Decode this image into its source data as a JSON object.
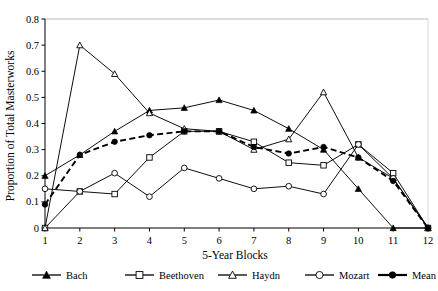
{
  "chart_data": {
    "type": "line",
    "title": "",
    "xlabel": "5-Year Blocks",
    "ylabel": "Proportion of Total Masterworks",
    "xlim": [
      1,
      12
    ],
    "ylim": [
      0,
      0.8
    ],
    "grid": false,
    "legend_position": "bottom",
    "x": [
      1,
      2,
      3,
      4,
      5,
      6,
      7,
      8,
      9,
      10,
      11,
      12
    ],
    "xticklabels": [
      "1",
      "2",
      "3",
      "4",
      "5",
      "6",
      "7",
      "8",
      "9",
      "10",
      "11",
      "12"
    ],
    "yticklabels": [
      "0",
      "0.1",
      "0.2",
      "0.3",
      "0.4",
      "0.5",
      "0.6",
      "0.7",
      "0.8"
    ],
    "ytickvalues": [
      0,
      0.1,
      0.2,
      0.3,
      0.4,
      0.5,
      0.6,
      0.7,
      0.8
    ],
    "series": [
      {
        "name": "Bach",
        "marker": "filled-triangle",
        "dash": "solid",
        "color": "#000000",
        "values": [
          0.2,
          0.28,
          0.37,
          0.45,
          0.46,
          0.49,
          0.45,
          0.38,
          0.3,
          0.15,
          0.0,
          0.0
        ]
      },
      {
        "name": "Beethoven",
        "marker": "open-square",
        "dash": "solid",
        "color": "#000000",
        "values": [
          0.0,
          0.14,
          0.13,
          0.27,
          0.37,
          0.37,
          0.33,
          0.25,
          0.24,
          0.32,
          0.21,
          0.0
        ]
      },
      {
        "name": "Haydn",
        "marker": "open-triangle",
        "dash": "solid",
        "color": "#000000",
        "values": [
          0.0,
          0.7,
          0.59,
          0.44,
          0.38,
          0.37,
          0.3,
          0.34,
          0.52,
          0.27,
          0.19,
          0.0
        ]
      },
      {
        "name": "Mozart",
        "marker": "open-circle",
        "dash": "solid",
        "color": "#000000",
        "values": [
          0.15,
          0.14,
          0.21,
          0.12,
          0.23,
          0.19,
          0.15,
          0.16,
          0.13,
          0.32,
          0.19,
          0.0
        ]
      },
      {
        "name": "Mean",
        "marker": "filled-circle",
        "dash": "dashed",
        "color": "#000000",
        "values": [
          0.09,
          0.28,
          0.33,
          0.355,
          0.37,
          0.37,
          0.31,
          0.285,
          0.31,
          0.27,
          0.18,
          0.0
        ]
      }
    ]
  },
  "legend": {
    "items": [
      {
        "label": "Bach",
        "marker": "filled-triangle",
        "dash": "solid"
      },
      {
        "label": "Beethoven",
        "marker": "open-square",
        "dash": "solid"
      },
      {
        "label": "Haydn",
        "marker": "open-triangle",
        "dash": "solid"
      },
      {
        "label": "Mozart",
        "marker": "open-circle",
        "dash": "solid"
      },
      {
        "label": "Mean",
        "marker": "filled-circle",
        "dash": "dashed"
      }
    ]
  }
}
